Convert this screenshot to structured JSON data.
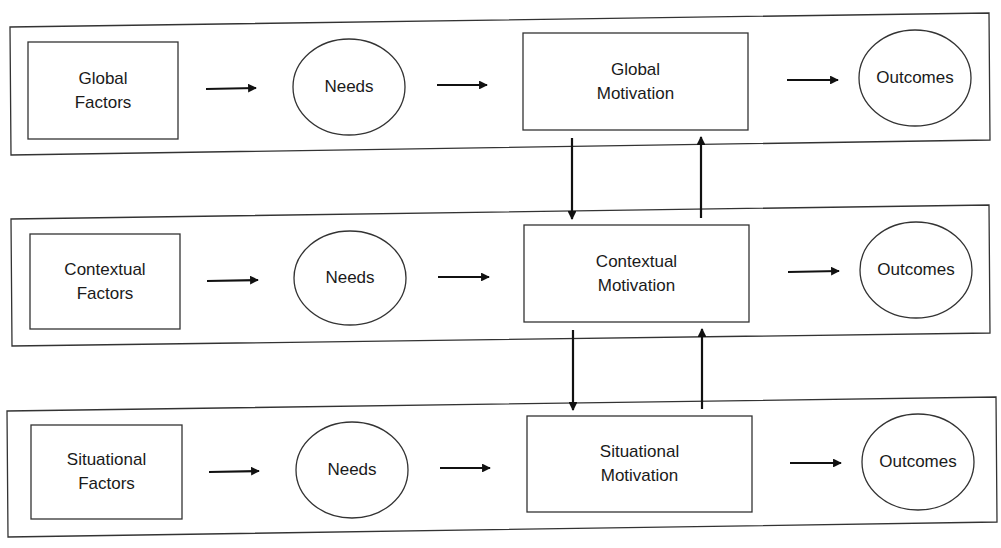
{
  "diagram": {
    "type": "hierarchical-flow",
    "levels": [
      {
        "name": "global",
        "factors": {
          "line1": "Global",
          "line2": "Factors"
        },
        "needs": "Needs",
        "motivation": {
          "line1": "Global",
          "line2": "Motivation"
        },
        "outcomes": "Outcomes"
      },
      {
        "name": "contextual",
        "factors": {
          "line1": "Contextual",
          "line2": "Factors"
        },
        "needs": "Needs",
        "motivation": {
          "line1": "Contextual",
          "line2": "Motivation"
        },
        "outcomes": "Outcomes"
      },
      {
        "name": "situational",
        "factors": {
          "line1": "Situational",
          "line2": "Factors"
        },
        "needs": "Needs",
        "motivation": {
          "line1": "Situational",
          "line2": "Motivation"
        },
        "outcomes": "Outcomes"
      }
    ],
    "connections": [
      "Factors -> Needs",
      "Needs -> Motivation",
      "Motivation -> Outcomes",
      "Global Motivation -> Contextual Motivation (down)",
      "Contextual Motivation -> Global Motivation (up)",
      "Contextual Motivation -> Situational Motivation (down)",
      "Situational Motivation -> Contextual Motivation (up)"
    ]
  }
}
